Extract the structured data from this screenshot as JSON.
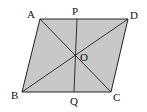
{
  "diagram": {
    "type": "parallelogram",
    "fill_color": "#c8c8c8",
    "stroke_color": "#222222",
    "vertices": {
      "A": {
        "label": "A",
        "x": 40,
        "y": 19
      },
      "D": {
        "label": "D",
        "x": 128,
        "y": 19
      },
      "C": {
        "label": "C",
        "x": 111,
        "y": 92
      },
      "B": {
        "label": "B",
        "x": 22,
        "y": 92
      }
    },
    "points": {
      "O": {
        "label": "O",
        "x": 75.5,
        "y": 55.5
      },
      "P": {
        "label": "P",
        "x": 77,
        "y": 19
      },
      "Q": {
        "label": "Q",
        "x": 74,
        "y": 92
      }
    },
    "segments": [
      "AC",
      "BD",
      "PQ"
    ]
  }
}
